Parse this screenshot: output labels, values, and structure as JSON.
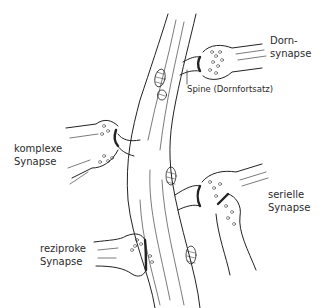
{
  "diagram": {
    "labels": {
      "dorn": {
        "line1": "Dorn-",
        "line2": "synapse"
      },
      "spine": "Spine (Dornfortsatz)",
      "komplex": {
        "line1": "komplexe",
        "line2": "Synapse"
      },
      "seriell": {
        "line1": "serielle",
        "line2": "Synapse"
      },
      "reziprok": {
        "line1": "reziproke",
        "line2": "Synapse"
      }
    },
    "colors": {
      "ink": "#222222",
      "background": "#ffffff"
    }
  }
}
